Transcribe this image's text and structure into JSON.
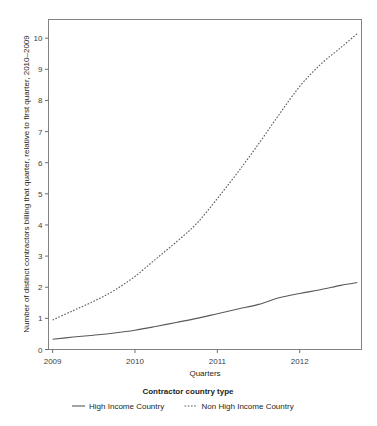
{
  "chart_data": {
    "type": "line",
    "title": "",
    "xlabel": "Quarters",
    "ylabel": "Number of distinct contractors billing that quarter, relative to first quarter, 2010–2009",
    "xlim": [
      2008.95,
      2012.75
    ],
    "ylim": [
      0,
      10.6
    ],
    "yticks": [
      0,
      1,
      2,
      3,
      4,
      5,
      6,
      7,
      8,
      9,
      10
    ],
    "ytick_labels": [
      "0",
      "1",
      "2",
      "3",
      "4",
      "5",
      "6",
      "7",
      "8",
      "9",
      "10"
    ],
    "xticks": [
      2009,
      2010,
      2011,
      2012
    ],
    "xtick_labels": [
      "2009",
      "2010",
      "2011",
      "2012"
    ],
    "grid": false,
    "legend_position": "bottom",
    "legend_title": "Contractor country type",
    "x": [
      2009.0,
      2009.25,
      2009.5,
      2009.75,
      2010.0,
      2010.25,
      2010.5,
      2010.75,
      2011.0,
      2011.25,
      2011.5,
      2011.75,
      2012.0,
      2012.25,
      2012.5,
      2012.7
    ],
    "series": [
      {
        "name": "High Income Country",
        "style": "solid",
        "color": "#58595b",
        "values": [
          0.33,
          0.4,
          0.46,
          0.53,
          0.62,
          0.74,
          0.87,
          1.0,
          1.15,
          1.3,
          1.45,
          1.66,
          1.8,
          1.92,
          2.06,
          2.15
        ]
      },
      {
        "name": "Non High Income Country",
        "style": "dotted",
        "color": "#58595b",
        "values": [
          0.95,
          1.25,
          1.55,
          1.9,
          2.35,
          2.9,
          3.45,
          4.05,
          4.85,
          5.7,
          6.6,
          7.55,
          8.45,
          9.15,
          9.7,
          10.15
        ]
      }
    ]
  },
  "axis": {
    "x_title": "Quarters",
    "y_title": "Number of distinct contractors billing that quarter, relative to first quarter, 2010–2009"
  },
  "legend": {
    "title": "Contractor country type",
    "entries": [
      {
        "label": "High Income Country",
        "style": "solid"
      },
      {
        "label": "Non High Income Country",
        "style": "dotted"
      }
    ]
  }
}
